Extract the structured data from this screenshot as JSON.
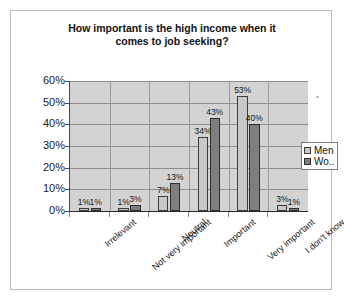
{
  "chart_data": {
    "type": "bar",
    "title": "How important is the high income when it comes to job seeking?",
    "title_line1": "How important is the high income when it",
    "title_line2": "comes to job seeking?",
    "xlabel": "",
    "ylabel": "",
    "ylim": [
      0,
      60
    ],
    "ytick_labels": [
      "0%",
      "10%",
      "20%",
      "30%",
      "40%",
      "50%",
      "60%"
    ],
    "ytick_values": [
      0,
      10,
      20,
      30,
      40,
      50,
      60
    ],
    "grid": true,
    "legend_position": "right",
    "categories": [
      "Irrelevant",
      "Not very important",
      "Neutral",
      "Important",
      "Very important",
      "I don't know"
    ],
    "series": [
      {
        "name": "Men",
        "color": "#c9c9c9",
        "values": [
          1,
          1,
          7,
          34,
          53,
          3
        ],
        "labels": [
          "1%",
          "1%",
          "7%",
          "34%",
          "53%",
          "3%"
        ]
      },
      {
        "name": "Wo..",
        "full_name": "Women",
        "color": "#7f7f7f",
        "values": [
          1,
          3,
          13,
          43,
          40,
          1
        ],
        "labels": [
          "1%",
          "3%",
          "13%",
          "43%",
          "40%",
          "1%"
        ]
      }
    ]
  },
  "legend": {
    "items": [
      {
        "label": "Men"
      },
      {
        "label": "Wo.."
      }
    ]
  }
}
